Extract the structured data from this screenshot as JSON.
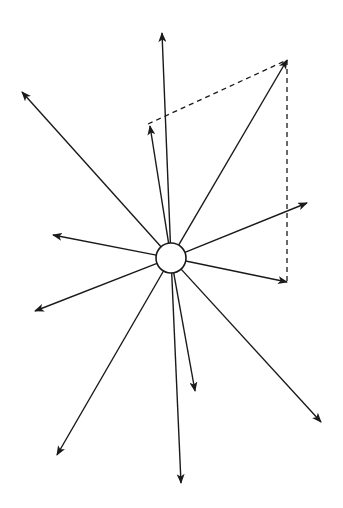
{
  "diagram": {
    "type": "vector-force-diagram",
    "colors": {
      "stroke": "#1a1a1a",
      "background": "#ffffff"
    },
    "center_node": {
      "cx": 171,
      "cy": 258,
      "r": 15
    },
    "vectors": [
      {
        "name": "vector-up",
        "to": [
          162,
          33
        ]
      },
      {
        "name": "vector-upper-left",
        "to": [
          22,
          92
        ]
      },
      {
        "name": "vector-short-up-left",
        "to": [
          150,
          126
        ]
      },
      {
        "name": "vector-resultant-upper-right",
        "to": [
          287,
          60
        ]
      },
      {
        "name": "vector-right-up",
        "to": [
          307,
          203
        ]
      },
      {
        "name": "vector-left",
        "to": [
          53,
          235
        ]
      },
      {
        "name": "vector-right-down",
        "to": [
          287,
          282
        ]
      },
      {
        "name": "vector-lower-left",
        "to": [
          35,
          311
        ]
      },
      {
        "name": "vector-down-left",
        "to": [
          57,
          455
        ]
      },
      {
        "name": "vector-down",
        "to": [
          181,
          483
        ]
      },
      {
        "name": "vector-short-down",
        "to": [
          195,
          391
        ]
      },
      {
        "name": "vector-down-right",
        "to": [
          321,
          422
        ]
      }
    ],
    "dashed_lines": [
      {
        "name": "dashed-parallel-top",
        "from": [
          148,
          124
        ],
        "to": [
          287,
          60
        ]
      },
      {
        "name": "dashed-parallel-right",
        "from": [
          287,
          60
        ],
        "to": [
          287,
          282
        ]
      }
    ]
  }
}
